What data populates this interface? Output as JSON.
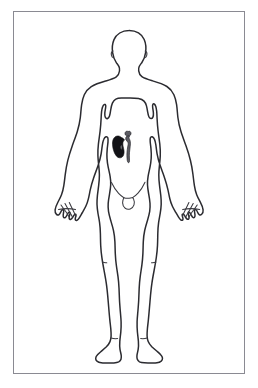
{
  "panel": {
    "name": "anatomical-body-diagram",
    "background_color": "#ffffff",
    "frame_color": "#8a8a92",
    "frame_style": "thin rectangular border"
  },
  "figure": {
    "label": "human body outline",
    "view": "anterior full body",
    "sex": "male",
    "pose": "standing, arms at sides",
    "outline_color": "#2b2b30",
    "fill_color": "#ffffff",
    "parts": [
      "head",
      "neck",
      "shoulders",
      "left-arm",
      "right-arm",
      "left-hand",
      "right-hand",
      "torso",
      "groin",
      "left-leg",
      "right-leg",
      "left-foot",
      "right-foot"
    ]
  },
  "highlight": {
    "label": "kidney and ureter",
    "organ_name": "kidney",
    "secondary_organ_name": "ureter",
    "side": "left side of image (anatomical right)",
    "fill_color": "#121216",
    "tube_color": "#5c5c63",
    "position": "upper abdomen, left of midline"
  },
  "text": {
    "labels": [],
    "caption": ""
  }
}
